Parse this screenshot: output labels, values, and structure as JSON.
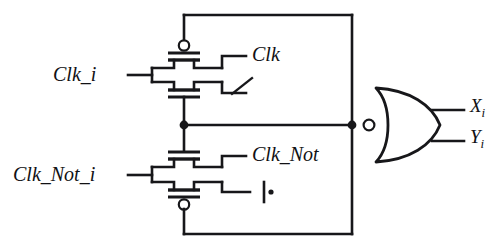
{
  "diagram": {
    "type": "circuit-schematic",
    "background_color": "#ffffff",
    "line_color": "#17171a"
  },
  "labels": {
    "clk_i": "Clk_i",
    "clk": "Clk",
    "clk_not_i": "Clk_Not_i",
    "clk_not": "Clk_Not",
    "out_x": "X",
    "out_x_sub": "i",
    "out_y": "Y",
    "out_y_sub": "i"
  },
  "components": [
    {
      "name": "upper-transmission-gate",
      "kind": "transmission-gate",
      "input_label": "Clk_i",
      "control_label": "Clk",
      "pmos_bubble": true,
      "bubble_position": "top"
    },
    {
      "name": "lower-transmission-gate",
      "kind": "transmission-gate",
      "input_label": "Clk_Not_i",
      "control_label": "Clk_Not",
      "pmos_bubble": true,
      "bubble_position": "bottom"
    },
    {
      "name": "nor-gate",
      "kind": "nor-gate",
      "orientation": "mirrored-output-left",
      "inputs": [
        "X_i",
        "Y_i"
      ],
      "inverting_bubble": true
    },
    {
      "name": "ground-symbol",
      "kind": "ground"
    },
    {
      "name": "slash-annotation",
      "kind": "diagonal-tick"
    }
  ],
  "nets": [
    {
      "name": "top-rail",
      "from": "upper-gate-drain",
      "to": "right-vertical-rail"
    },
    {
      "name": "bottom-rail",
      "from": "lower-gate-drain",
      "to": "right-vertical-rail"
    },
    {
      "name": "center-node",
      "from": "gate-midpoint",
      "to": "nor-output-junction"
    },
    {
      "name": "right-vertical-rail",
      "from": "top-rail",
      "to": "bottom-rail"
    }
  ]
}
